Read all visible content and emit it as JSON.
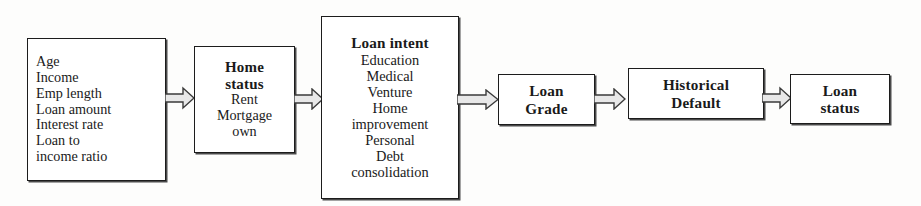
{
  "diagram": {
    "background_color": "#fdfdfc",
    "box_border_color": "#1c1c1c",
    "arrow_fill_color": "#e8e8e8",
    "arrow_stroke_color": "#3a3a3a",
    "nodes": [
      {
        "id": "applicant",
        "heading": "",
        "options": [
          "Age",
          "Income",
          "Emp length",
          "Loan amount",
          "Interest rate",
          "Loan to",
          "income ratio"
        ]
      },
      {
        "id": "home_status",
        "heading_line_1": "Home",
        "heading_line_2": "status",
        "options": [
          "Rent",
          "Mortgage",
          "own"
        ]
      },
      {
        "id": "loan_intent",
        "heading": "Loan intent",
        "options": [
          "Education",
          "Medical",
          "Venture",
          "Home",
          "improvement",
          "Personal",
          "Debt",
          "consolidation"
        ]
      },
      {
        "id": "loan_grade",
        "heading_line_1": "Loan",
        "heading_line_2": "Grade"
      },
      {
        "id": "historical_default",
        "heading_line_1": "Historical",
        "heading_line_2": "Default"
      },
      {
        "id": "loan_status",
        "heading_line_1": "Loan",
        "heading_line_2": "status"
      }
    ],
    "connectors": [
      {
        "id": "arrow-1",
        "from": "applicant",
        "to": "home_status",
        "icon": "right-arrow-icon"
      },
      {
        "id": "arrow-2",
        "from": "home_status",
        "to": "loan_intent",
        "icon": "right-arrow-icon"
      },
      {
        "id": "arrow-3",
        "from": "loan_intent",
        "to": "loan_grade",
        "icon": "right-arrow-icon"
      },
      {
        "id": "arrow-4",
        "from": "loan_grade",
        "to": "historical_default",
        "icon": "right-arrow-icon"
      },
      {
        "id": "arrow-5",
        "from": "historical_default",
        "to": "loan_status",
        "icon": "right-arrow-icon"
      }
    ]
  }
}
